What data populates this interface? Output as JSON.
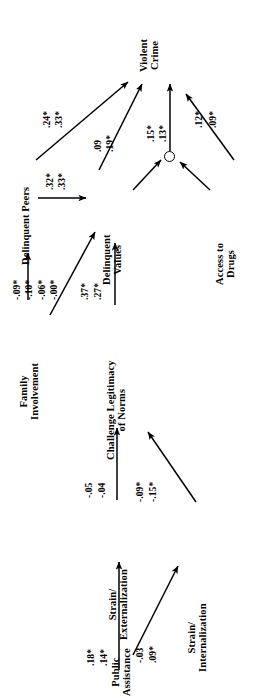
{
  "figure": {
    "type": "path-diagram",
    "orientation": "rotated-90-ccw",
    "note_significance": "*",
    "nodes": [
      {
        "id": "violent_crime",
        "label_lines": [
          "Violent",
          "Crime"
        ]
      },
      {
        "id": "delinquent_peers",
        "label_lines": [
          "Delinquent Peers"
        ]
      },
      {
        "id": "delinquent_values",
        "label_lines": [
          "Delinquent",
          "Values"
        ]
      },
      {
        "id": "access_to_drugs",
        "label_lines": [
          "Access to",
          "Drugs"
        ]
      },
      {
        "id": "family_involvement",
        "label_lines": [
          "Family",
          "Involvement"
        ]
      },
      {
        "id": "challenge_legitimacy",
        "label_lines": [
          "Challenge Legitimacy",
          "of Norms"
        ]
      },
      {
        "id": "strain_external",
        "label_lines": [
          "Strain/",
          "Externalization"
        ]
      },
      {
        "id": "strain_internal",
        "label_lines": [
          "Strain/",
          "Internalization"
        ]
      },
      {
        "id": "mediator_circle",
        "label_lines": []
      },
      {
        "id": "public_assistance",
        "label_lines": [
          "Public",
          "Assistance"
        ]
      }
    ],
    "paths": [
      {
        "id": "peers_to_crime",
        "from": "delinquent_peers",
        "to": "violent_crime",
        "coefficients": [
          ".24*",
          ".33*"
        ]
      },
      {
        "id": "peers_to_values",
        "from": "delinquent_peers",
        "to": "delinquent_values",
        "coefficients": [
          ".32*",
          ".33*"
        ]
      },
      {
        "id": "values_to_crime",
        "from": "delinquent_values",
        "to": "violent_crime",
        "coefficients": [
          ".09",
          ".19*"
        ]
      },
      {
        "id": "mid_to_crime",
        "from": "mediator_circle",
        "to": "violent_crime",
        "coefficients": [
          ".15*",
          ".13*"
        ]
      },
      {
        "id": "drugs_to_crime",
        "from": "access_to_drugs",
        "to": "violent_crime",
        "coefficients": [
          ".12*",
          ".09*"
        ]
      },
      {
        "id": "family_to_peers",
        "from": "family_involvement",
        "to": "delinquent_peers",
        "coefficients": [
          "-.09*",
          "-.10*"
        ]
      },
      {
        "id": "family_to_values",
        "from": "family_involvement",
        "to": "delinquent_values",
        "coefficients": [
          "-.06*",
          "-.00*"
        ]
      },
      {
        "id": "legit_to_values",
        "from": "challenge_legitimacy",
        "to": "delinquent_values",
        "coefficients": [
          ".37*",
          ".27*"
        ]
      },
      {
        "id": "strainx_to_legit",
        "from": "strain_external",
        "to": "challenge_legitimacy",
        "coefficients": [
          "-.05",
          "-.04"
        ]
      },
      {
        "id": "straini_to_legit",
        "from": "strain_internal",
        "to": "challenge_legitimacy",
        "coefficients": [
          "-.09*",
          "-.15*"
        ]
      },
      {
        "id": "pub_to_strainx",
        "from": "public_assistance",
        "to": "strain_external",
        "coefficients": [
          ".18*",
          ".14*"
        ]
      },
      {
        "id": "pub_to_straini",
        "from": "public_assistance",
        "to": "strain_internal",
        "coefficients": [
          "-.03",
          ".09*"
        ]
      }
    ],
    "coefficient_labels": {
      "peers_crime_1": ".24*",
      "peers_crime_2": ".33*",
      "peers_values_1": ".32*",
      "peers_values_2": ".33*",
      "values_crime_1": ".09",
      "values_crime_2": ".19*",
      "mid_crime_1": ".15*",
      "mid_crime_2": ".13*",
      "drugs_crime_1": ".12*",
      "drugs_crime_2": ".09*",
      "family_peers_1": "-.09*",
      "family_peers_2": "-.10*",
      "family_values_1": "-.06*",
      "family_values_2": "-.00*",
      "legit_values_1": ".37*",
      "legit_values_2": ".27*",
      "strainx_legit_1": "-.05",
      "strainx_legit_2": "-.04",
      "straini_legit_1": "-.09*",
      "straini_legit_2": "-.15*",
      "pub_strainx_1": ".18*",
      "pub_strainx_2": ".14*",
      "pub_straini_1": "-.03",
      "pub_straini_2": ".09*"
    },
    "node_labels": {
      "violent_crime_l1": "Violent",
      "violent_crime_l2": "Crime",
      "delinquent_peers_l1": "Delinquent Peers",
      "delinquent_values_l1": "Delinquent",
      "delinquent_values_l2": "Values",
      "access_drugs_l1": "Access to",
      "access_drugs_l2": "Drugs",
      "family_l1": "Family",
      "family_l2": "Involvement",
      "legit_l1": "Challenge Legitimacy",
      "legit_l2": "of Norms",
      "strainx_l1": "Strain/",
      "strainx_l2": "Externalization",
      "straini_l1": "Strain/",
      "straini_l2": "Internalization",
      "public_l1": "Public",
      "public_l2": "Assistance"
    }
  }
}
